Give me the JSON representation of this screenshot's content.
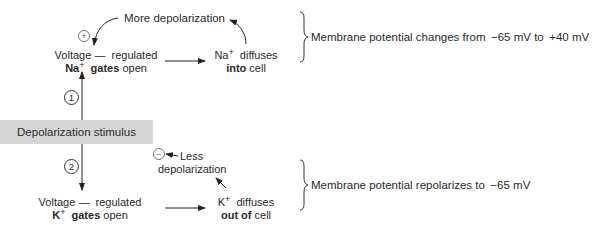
{
  "diagram": {
    "stimulus": "Depolarization stimulus",
    "pathway1": {
      "step_number": "1",
      "gate_line1_a": "Voltage",
      "gate_line1_dash": "—",
      "gate_line1_b": "regulated",
      "gate_ion": "Na",
      "gate_ion_charge": "+",
      "gate_bold": "gates",
      "gate_rest": "open",
      "result_ion": "Na",
      "result_ion_charge": "+",
      "result_line1_rest": "diffuses",
      "result_bold": "into",
      "result_rest": "cell",
      "feedback_label": "More depolarization",
      "feedback_sign": "+",
      "summary": "Membrane potential changes from  −65 mV to  +40 mV"
    },
    "pathway2": {
      "step_number": "2",
      "gate_line1_a": "Voltage",
      "gate_line1_dash": "—",
      "gate_line1_b": "regulated",
      "gate_ion": "K",
      "gate_ion_charge": "+",
      "gate_bold": "gates",
      "gate_rest": "open",
      "result_ion": "K",
      "result_ion_charge": "+",
      "result_line1_rest": "diffuses",
      "result_bold": "out of",
      "result_rest": "cell",
      "feedback_label_line1": "Less",
      "feedback_label_line2": "depolarization",
      "feedback_sign": "−",
      "summary": "Membrane potential repolarizes to  −65 mV"
    },
    "colors": {
      "text": "#2a2a2a",
      "stimulus_box": "#d6d6d6",
      "background": "#ffffff"
    }
  }
}
